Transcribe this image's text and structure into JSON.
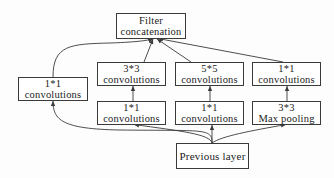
{
  "diagram": {
    "nodes": {
      "concat": {
        "line1": "Filter",
        "line2": "concatenation"
      },
      "branch1_conv1x1": {
        "line1": "1*1",
        "line2": "convolutions"
      },
      "branch2_conv3x3": {
        "line1": "3*3",
        "line2": "convolutions"
      },
      "branch3_conv5x5": {
        "line1": "5*5",
        "line2": "convolutions"
      },
      "branch4_conv1x1": {
        "line1": "1*1",
        "line2": "convolutions"
      },
      "branch2_reduce1x1": {
        "line1": "1*1",
        "line2": "convolutions"
      },
      "branch3_reduce1x1": {
        "line1": "1*1",
        "line2": "convolutions"
      },
      "branch4_maxpool": {
        "line1": "3*3",
        "line2": "Max pooling"
      },
      "input": {
        "line1": "Previous layer"
      }
    },
    "edges": [
      {
        "from": "input",
        "to": "branch1_conv1x1"
      },
      {
        "from": "input",
        "to": "branch2_reduce1x1"
      },
      {
        "from": "input",
        "to": "branch3_reduce1x1"
      },
      {
        "from": "input",
        "to": "branch4_maxpool"
      },
      {
        "from": "branch2_reduce1x1",
        "to": "branch2_conv3x3"
      },
      {
        "from": "branch3_reduce1x1",
        "to": "branch3_conv5x5"
      },
      {
        "from": "branch4_maxpool",
        "to": "branch4_conv1x1"
      },
      {
        "from": "branch1_conv1x1",
        "to": "concat"
      },
      {
        "from": "branch2_conv3x3",
        "to": "concat"
      },
      {
        "from": "branch3_conv5x5",
        "to": "concat"
      },
      {
        "from": "branch4_conv1x1",
        "to": "concat"
      }
    ],
    "colors": {
      "stroke": "#3a3a3a",
      "background": "#ffffff",
      "text": "#222222"
    }
  }
}
